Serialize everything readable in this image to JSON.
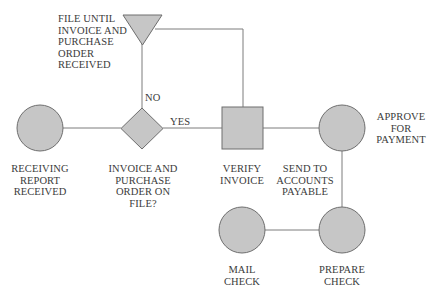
{
  "diagram": {
    "type": "flowchart",
    "colors": {
      "shape_fill": "#c4c4c4",
      "shape_stroke": "#6a6a6a",
      "line": "#7a7a7a",
      "text": "#3b3b3b"
    },
    "nodes": [
      {
        "id": "file",
        "shape": "triangle",
        "label": "FILE UNTIL\nINVOICE AND\nPURCHASE\nORDER\nRECEIVED"
      },
      {
        "id": "receiving",
        "shape": "circle",
        "label": "RECEIVING\nREPORT\nRECEIVED"
      },
      {
        "id": "decision",
        "shape": "diamond",
        "label": "INVOICE AND\nPURCHASE\nORDER ON\nFILE?"
      },
      {
        "id": "verify",
        "shape": "square",
        "label": "VERIFY\nINVOICE"
      },
      {
        "id": "send",
        "shape": "label",
        "label": "SEND TO\nACCOUNTS\nPAYABLE"
      },
      {
        "id": "approve",
        "shape": "circle",
        "label": "APPROVE\nFOR\nPAYMENT"
      },
      {
        "id": "prepare",
        "shape": "circle",
        "label": "PREPARE\nCHECK"
      },
      {
        "id": "mail",
        "shape": "circle",
        "label": "MAIL\nCHECK"
      }
    ],
    "edges": [
      {
        "from": "receiving",
        "to": "decision",
        "label": ""
      },
      {
        "from": "decision",
        "to": "file",
        "label": "NO"
      },
      {
        "from": "decision",
        "to": "verify",
        "label": "YES"
      },
      {
        "from": "file",
        "to": "verify",
        "label": ""
      },
      {
        "from": "verify",
        "to": "approve",
        "label": ""
      },
      {
        "from": "approve",
        "to": "prepare",
        "label": ""
      },
      {
        "from": "prepare",
        "to": "mail",
        "label": ""
      }
    ],
    "edge_labels": {
      "no": "NO",
      "yes": "YES"
    }
  }
}
